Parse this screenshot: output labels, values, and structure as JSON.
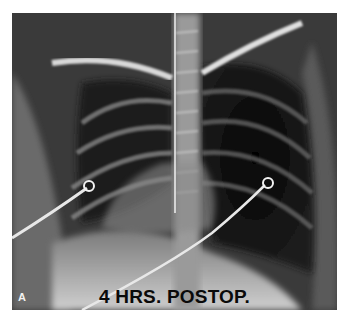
{
  "figure": {
    "panel_label": "A",
    "caption": "4 HRS. POSTOP."
  }
}
